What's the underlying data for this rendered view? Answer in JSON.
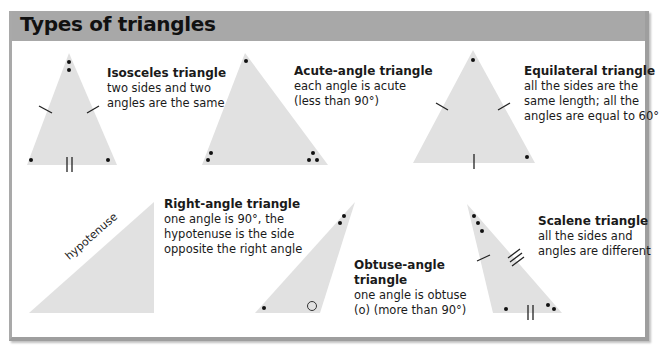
{
  "title": "Types of triangles",
  "colors": {
    "header_bg": "#a8a8a8",
    "triangle_fill": "#e1e1e1",
    "mark": "#111111"
  },
  "triangles": [
    {
      "name": "Isosceles triangle",
      "lines": [
        "two sides and two",
        "angles are the same"
      ]
    },
    {
      "name": "Acute-angle triangle",
      "lines": [
        "each angle is acute",
        "(less than 90°)"
      ]
    },
    {
      "name": "Equilateral triangle",
      "lines": [
        "all the sides are the",
        "same length; all the",
        "angles are equal to 60°"
      ]
    },
    {
      "name": "Right-angle triangle",
      "lines": [
        "one angle is 90°, the",
        "hypotenuse is the side",
        "opposite the right angle"
      ],
      "side_label": "hypotenuse"
    },
    {
      "name_lines": [
        "Obtuse-angle",
        "triangle"
      ],
      "lines": [
        "one angle is obtuse",
        "(o) (more than 90°)"
      ]
    },
    {
      "name": "Scalene triangle",
      "lines": [
        "all the sides and",
        "angles are different"
      ]
    }
  ]
}
